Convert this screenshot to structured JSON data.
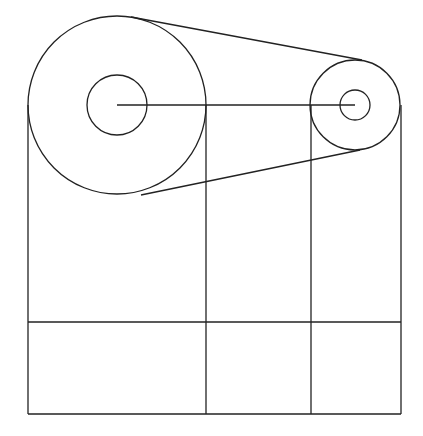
{
  "diagram": {
    "type": "belt-pulley-drawing",
    "stroke_color": "#222222",
    "background": "#ffffff",
    "large_pulley": {
      "cx": 117,
      "cy": 105,
      "r_outer": 89,
      "r_inner": 30
    },
    "small_pulley": {
      "cx": 355,
      "cy": 105,
      "r_outer": 45,
      "r_inner": 15
    },
    "center_line": {
      "x1": 117,
      "y1": 105,
      "x2": 355,
      "y2": 105
    },
    "verticals_x": [
      28,
      206,
      311,
      401
    ],
    "grid_row_y": 322,
    "bottom_y": 414
  }
}
